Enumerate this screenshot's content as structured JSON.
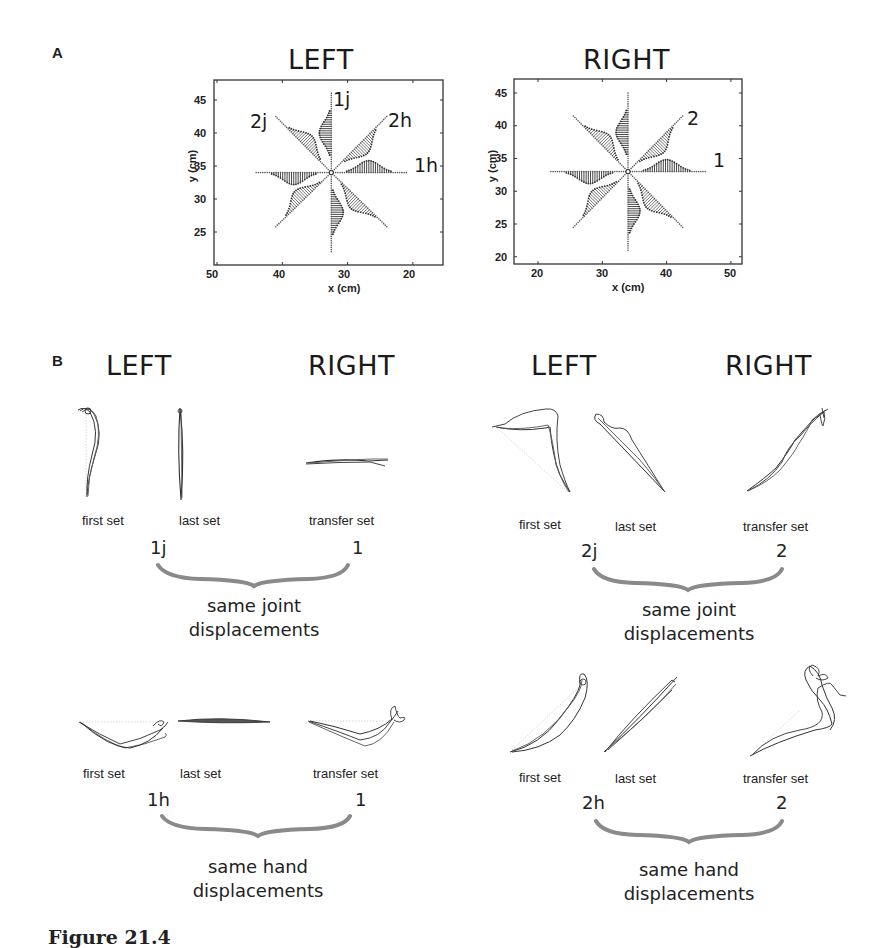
{
  "panel_a": {
    "label": "A",
    "left": {
      "title": "LEFT",
      "xlabel": "x (cm)",
      "ylabel": "y (cm)",
      "xticks": [
        "50",
        "40",
        "30",
        "20"
      ],
      "yticks": [
        "45",
        "40",
        "35",
        "30",
        "25"
      ],
      "annotations": [
        "1j",
        "2j",
        "2h",
        "1h"
      ]
    },
    "right": {
      "title": "RIGHT",
      "xlabel": "x (cm)",
      "ylabel": "y (cm)",
      "xticks": [
        "20",
        "30",
        "40",
        "50"
      ],
      "yticks": [
        "45",
        "40",
        "35",
        "30",
        "25",
        "20"
      ],
      "annotations": [
        "2",
        "1"
      ]
    }
  },
  "panel_b": {
    "label": "B",
    "groups": [
      {
        "left_title": "LEFT",
        "right_title": "RIGHT",
        "set_labels": [
          "first set",
          "last set",
          "transfer set"
        ],
        "left_num": "1j",
        "right_num": "1",
        "caption_line1": "same joint",
        "caption_line2": "displacements"
      },
      {
        "left_title": "LEFT",
        "right_title": "RIGHT",
        "set_labels": [
          "first set",
          "last set",
          "transfer set"
        ],
        "left_num": "2j",
        "right_num": "2",
        "caption_line1": "same joint",
        "caption_line2": "displacements"
      },
      {
        "set_labels": [
          "first set",
          "last set",
          "transfer set"
        ],
        "left_num": "1h",
        "right_num": "1",
        "caption_line1": "same hand",
        "caption_line2": "displacements"
      },
      {
        "set_labels": [
          "first set",
          "last set",
          "transfer set"
        ],
        "left_num": "2h",
        "right_num": "2",
        "caption_line1": "same hand",
        "caption_line2": "displacements"
      }
    ]
  },
  "figure_caption": "Figure 21.4",
  "chart_data": [
    {
      "type": "scatter",
      "title": "LEFT",
      "xlabel": "x (cm)",
      "ylabel": "y (cm)",
      "xlim": [
        50,
        15
      ],
      "ylim": [
        20,
        48
      ],
      "grid": false,
      "description": "8 center-out reach directions from center (32.5, 34); hatched velocity profiles along each arm",
      "center": [
        32.5,
        34
      ],
      "arm_endpoints": [
        [
          32.5,
          46
        ],
        [
          24,
          42.5
        ],
        [
          21,
          34
        ],
        [
          24,
          25.8
        ],
        [
          32.5,
          22
        ],
        [
          41,
          25.8
        ],
        [
          44,
          34
        ],
        [
          41,
          42.5
        ]
      ],
      "annotations": [
        {
          "text": "1j",
          "x": 30.5,
          "y": 46
        },
        {
          "text": "2j",
          "x": 43,
          "y": 42
        },
        {
          "text": "2h",
          "x": 21.5,
          "y": 42
        },
        {
          "text": "1h",
          "x": 17,
          "y": 34
        }
      ]
    },
    {
      "type": "scatter",
      "title": "RIGHT",
      "xlabel": "x (cm)",
      "ylabel": "y (cm)",
      "xlim": [
        16,
        52
      ],
      "ylim": [
        19,
        47.5
      ],
      "grid": false,
      "description": "8 center-out reach directions from center (34, 33); hatched velocity profiles along each arm",
      "center": [
        34,
        33
      ],
      "arm_endpoints": [
        [
          34,
          45
        ],
        [
          42.5,
          41.5
        ],
        [
          46,
          33
        ],
        [
          42.5,
          24.5
        ],
        [
          34,
          21
        ],
        [
          25.5,
          24.5
        ],
        [
          22,
          33
        ],
        [
          25.5,
          41.5
        ]
      ],
      "annotations": [
        {
          "text": "2",
          "x": 45,
          "y": 41
        },
        {
          "text": "1",
          "x": 48.5,
          "y": 33
        }
      ]
    }
  ]
}
